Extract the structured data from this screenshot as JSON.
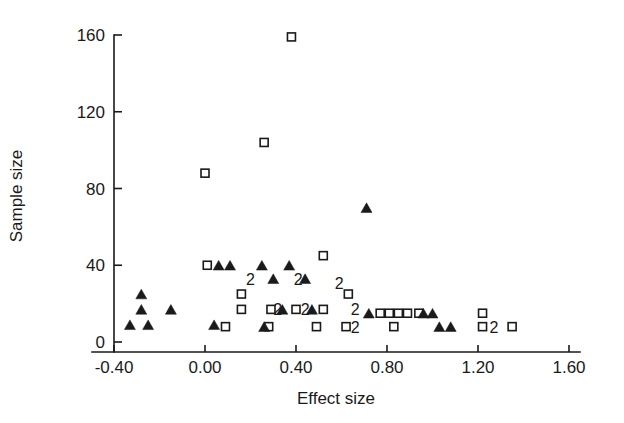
{
  "chart_data": {
    "type": "scatter",
    "title": "",
    "xlabel": "Effect size",
    "ylabel": "Sample size",
    "xlim": [
      -0.6,
      1.6
    ],
    "ylim": [
      -8,
      168
    ],
    "grid": false,
    "legend_position": "none",
    "xticks": [
      -0.4,
      0.0,
      0.4,
      0.8,
      1.2,
      1.6
    ],
    "xticklabels": [
      "-0.40",
      "0.00",
      "0.40",
      "0.80",
      "1.20",
      "1.60"
    ],
    "yticks": [
      0,
      40,
      80,
      120,
      160
    ],
    "yticklabels": [
      "0",
      "40",
      "80",
      "120",
      "160"
    ],
    "series": [
      {
        "name": "open-square",
        "marker": "open square",
        "color": "#1a1a1a",
        "points": [
          {
            "x": 0.38,
            "y": 159
          },
          {
            "x": 0.26,
            "y": 104
          },
          {
            "x": 0.0,
            "y": 88
          },
          {
            "x": 0.52,
            "y": 45
          },
          {
            "x": 0.01,
            "y": 40
          },
          {
            "x": 0.16,
            "y": 25
          },
          {
            "x": 0.63,
            "y": 25
          },
          {
            "x": 0.16,
            "y": 17
          },
          {
            "x": 0.29,
            "y": 17
          },
          {
            "x": 0.4,
            "y": 17
          },
          {
            "x": 0.52,
            "y": 17
          },
          {
            "x": 0.77,
            "y": 15
          },
          {
            "x": 0.81,
            "y": 15
          },
          {
            "x": 0.85,
            "y": 15
          },
          {
            "x": 0.89,
            "y": 15
          },
          {
            "x": 0.94,
            "y": 15
          },
          {
            "x": 1.22,
            "y": 15
          },
          {
            "x": 0.09,
            "y": 8
          },
          {
            "x": 0.28,
            "y": 8
          },
          {
            "x": 0.49,
            "y": 8
          },
          {
            "x": 0.62,
            "y": 8
          },
          {
            "x": 0.83,
            "y": 8
          },
          {
            "x": 1.22,
            "y": 8
          },
          {
            "x": 1.35,
            "y": 8
          }
        ]
      },
      {
        "name": "filled-triangle",
        "marker": "filled triangle",
        "color": "#1a1a1a",
        "points": [
          {
            "x": 0.71,
            "y": 70
          },
          {
            "x": 0.06,
            "y": 40
          },
          {
            "x": 0.11,
            "y": 40
          },
          {
            "x": 0.25,
            "y": 40
          },
          {
            "x": 0.37,
            "y": 40
          },
          {
            "x": 0.3,
            "y": 33
          },
          {
            "x": 0.44,
            "y": 33
          },
          {
            "x": -0.28,
            "y": 25
          },
          {
            "x": -0.28,
            "y": 17
          },
          {
            "x": -0.15,
            "y": 17
          },
          {
            "x": 0.34,
            "y": 17
          },
          {
            "x": 0.47,
            "y": 17
          },
          {
            "x": 0.72,
            "y": 15
          },
          {
            "x": 0.96,
            "y": 15
          },
          {
            "x": 1.0,
            "y": 15
          },
          {
            "x": -0.33,
            "y": 9
          },
          {
            "x": -0.25,
            "y": 9
          },
          {
            "x": 0.04,
            "y": 9
          },
          {
            "x": 0.26,
            "y": 8
          },
          {
            "x": 1.03,
            "y": 8
          },
          {
            "x": 1.08,
            "y": 8
          }
        ]
      }
    ],
    "duplicate_labels": [
      {
        "x": 0.2,
        "y": 33,
        "text": "2"
      },
      {
        "x": 0.41,
        "y": 33,
        "text": "2"
      },
      {
        "x": 0.59,
        "y": 31,
        "text": "2"
      },
      {
        "x": 0.32,
        "y": 17,
        "text": "2"
      },
      {
        "x": 0.44,
        "y": 17,
        "text": "2"
      },
      {
        "x": 0.66,
        "y": 17,
        "text": "2"
      },
      {
        "x": 0.66,
        "y": 8,
        "text": "2"
      },
      {
        "x": 1.27,
        "y": 8,
        "text": "2"
      }
    ]
  },
  "geometry": {
    "plot_left": 114,
    "plot_right": 569,
    "plot_bottom": 342,
    "plot_top": 35,
    "px_per_x_unit": 227.5,
    "px_per_y_unit": 1.91875,
    "x_origin_px": 205,
    "y_origin_px": 342,
    "axis_x_start": 92,
    "axis_x_end": 580,
    "axis_y_bottom": 352,
    "axis_y_top": 35,
    "marker_square_size": 8,
    "marker_triangle_size": 11
  },
  "style": {
    "background": "#ffffff",
    "ink": "#1a1a1a"
  }
}
